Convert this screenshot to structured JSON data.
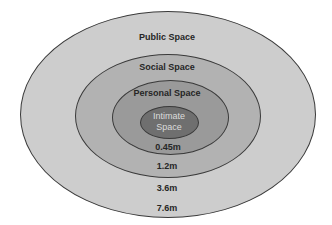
{
  "diagram": {
    "zones": [
      {
        "name": "Public Space",
        "distance": "7.6m",
        "fill": "#cdcdcd"
      },
      {
        "name": "Social Space",
        "distance": "3.6m",
        "fill": "#b2b2b2"
      },
      {
        "name": "Personal Space",
        "distance": "1.2m",
        "fill": "#9a9a9a"
      },
      {
        "name": "Intimate Space",
        "line1": "Intimate",
        "line2": "Space",
        "distance": "0.45m",
        "fill": "#6f6f6f"
      }
    ]
  }
}
